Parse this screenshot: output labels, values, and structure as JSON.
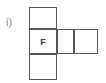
{
  "figure": {
    "item_label": "i)",
    "type": "cube-net",
    "line_color": "#555555",
    "fill_color": "#ffffff",
    "label_color": "#8a8a8a",
    "cells": [
      {
        "name": "net-cell-top",
        "face_label": "",
        "x": 29,
        "y": 7,
        "w": 28,
        "h": 22,
        "row": 0,
        "col": 0
      },
      {
        "name": "net-cell-middle-left",
        "face_label": "F",
        "x": 29,
        "y": 29,
        "w": 28,
        "h": 25,
        "row": 1,
        "col": 0
      },
      {
        "name": "net-cell-middle-center",
        "face_label": "",
        "x": 57,
        "y": 29,
        "w": 17,
        "h": 25,
        "row": 1,
        "col": 1
      },
      {
        "name": "net-cell-middle-right",
        "face_label": "",
        "x": 74,
        "y": 29,
        "w": 24,
        "h": 25,
        "row": 1,
        "col": 2
      },
      {
        "name": "net-cell-bottom",
        "face_label": "",
        "x": 29,
        "y": 54,
        "w": 28,
        "h": 26,
        "row": 2,
        "col": 0
      }
    ]
  }
}
